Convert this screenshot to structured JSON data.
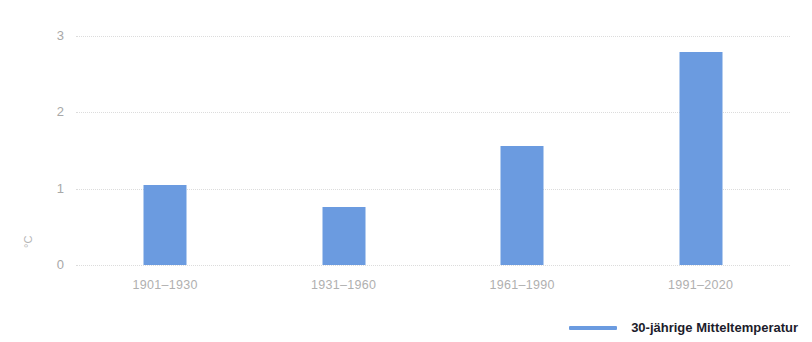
{
  "chart_data": {
    "type": "bar",
    "title": "",
    "xlabel": "",
    "ylabel": "°C",
    "ylim": [
      0,
      3
    ],
    "yticks": [
      "0",
      "1",
      "2",
      "3"
    ],
    "grid": true,
    "legend_position": "bottom-right",
    "categories": [
      "1901–1930",
      "1931–1960",
      "1961–1990",
      "1991–2020"
    ],
    "series": [
      {
        "name": "30-jährige Mitteltemperatur",
        "color": "#6b9be0",
        "values": [
          1.05,
          0.76,
          1.56,
          2.79
        ]
      }
    ]
  },
  "axes": {
    "y": {
      "title": "°C",
      "ticks": [
        {
          "label": "3",
          "value": 3
        },
        {
          "label": "2",
          "value": 2
        },
        {
          "label": "1",
          "value": 1
        },
        {
          "label": "0",
          "value": 0
        }
      ]
    },
    "x": {
      "ticks": [
        {
          "label": "1901–1930"
        },
        {
          "label": "1931–1960"
        },
        {
          "label": "1961–1990"
        },
        {
          "label": "1991–2020"
        }
      ]
    }
  },
  "legend": {
    "items": [
      {
        "label": "30-jährige Mitteltemperatur",
        "color": "#6b9be0"
      }
    ]
  },
  "colors": {
    "bar": "#6b9be0",
    "grid": "#dcdcdc",
    "tick_text": "#b0b0b0",
    "legend_text": "#1c1c2b",
    "background": "#ffffff"
  }
}
